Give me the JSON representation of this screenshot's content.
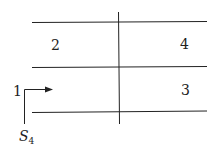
{
  "diagram": {
    "regions": [
      {
        "id": "2",
        "label": "2"
      },
      {
        "id": "4",
        "label": "4"
      },
      {
        "id": "3",
        "label": "3"
      }
    ],
    "inlet": {
      "label": "1",
      "section_symbol": "S",
      "section_subscript": "4"
    },
    "colors": {
      "line": "#222222",
      "background": "#ffffff"
    }
  }
}
